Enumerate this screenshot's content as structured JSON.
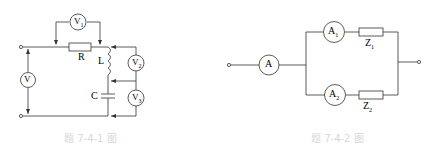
{
  "figure1": {
    "caption": "题 7-4-1 图",
    "labels": {
      "V": "V",
      "V1": "V",
      "V1_sub": "1",
      "V2": "V",
      "V2_sub": "2",
      "V3": "V",
      "V3_sub": "3",
      "R": "R",
      "L": "L",
      "C": "C"
    }
  },
  "figure2": {
    "caption": "题 7-4-2 图",
    "labels": {
      "A": "A",
      "A1": "A",
      "A1_sub": "1",
      "A2": "A",
      "A2_sub": "2",
      "Z1": "Z",
      "Z1_sub": "1",
      "Z2": "Z",
      "Z2_sub": "2"
    }
  }
}
